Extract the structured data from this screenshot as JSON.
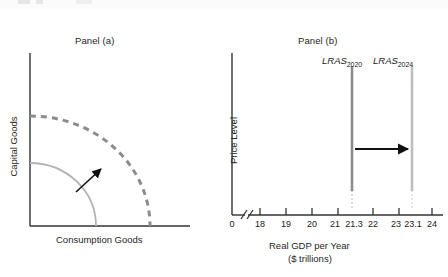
{
  "figure": {
    "panel_a": {
      "title": "Panel (a)",
      "ylabel": "Capital Goods",
      "xlabel": "Consumption Goods",
      "curves": [
        {
          "name": "initial-ppf",
          "style": "solid",
          "color": "#b3b3b3"
        },
        {
          "name": "shifted-ppf",
          "style": "dashed",
          "color": "#8c8c8c"
        }
      ],
      "annotation": {
        "name": "growth-arrow",
        "color": "#111111"
      }
    },
    "panel_b": {
      "title": "Panel (b)",
      "ylabel": "Price Level",
      "xlabel_line1": "Real GDP per Year",
      "xlabel_line2": "($ trillions)",
      "lras_lines": [
        {
          "label": "LRAS",
          "subscript": "2020",
          "value": 21.3,
          "color": "#8c8c8c"
        },
        {
          "label": "LRAS",
          "subscript": "2024",
          "value": 23.1,
          "color": "#bfbfbf"
        }
      ],
      "shift_arrow": {
        "name": "lras-shift-arrow",
        "from": 21.3,
        "to": 23.1,
        "color": "#111111"
      },
      "axis_break": true
    }
  },
  "chart_data": [
    {
      "type": "line",
      "name": "panel-a-ppf",
      "title": "Panel (a)",
      "xlabel": "Consumption Goods",
      "ylabel": "Capital Goods",
      "grid": false,
      "legend": "none",
      "series": [
        {
          "name": "PPF initial",
          "style": "solid",
          "color": "#b3b3b3",
          "radius": 0.52
        },
        {
          "name": "PPF after growth",
          "style": "dashed",
          "color": "#8c8c8c",
          "radius": 0.86
        }
      ],
      "annotations": [
        {
          "type": "arrow",
          "text": "",
          "direction": "outward",
          "color": "#111111"
        }
      ]
    },
    {
      "type": "line",
      "name": "panel-b-lras",
      "title": "Panel (b)",
      "xlabel": "Real GDP per Year ($ trillions)",
      "ylabel": "Price Level",
      "grid": false,
      "legend": "none",
      "xlim": [
        17.5,
        24.4
      ],
      "xticks": [
        0,
        18,
        19,
        20,
        21,
        21.3,
        22,
        23,
        23.1,
        24
      ],
      "xticklabels": [
        "0",
        "18",
        "19",
        "20",
        "21",
        "21.3",
        "22",
        "23",
        "23.1",
        "24"
      ],
      "axis_break_after": "0",
      "series": [
        {
          "name": "LRAS2020",
          "type": "vline",
          "x": 21.3,
          "color": "#8c8c8c"
        },
        {
          "name": "LRAS2024",
          "type": "vline",
          "x": 23.1,
          "color": "#bfbfbf"
        }
      ],
      "annotations": [
        {
          "type": "arrow",
          "x_from": 21.3,
          "x_to": 23.1,
          "text": "",
          "color": "#111111"
        }
      ]
    }
  ]
}
